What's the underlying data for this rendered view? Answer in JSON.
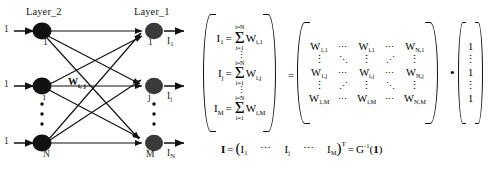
{
  "figure": {
    "type": "neural-network-matrix-equation",
    "background_color": "#ffffff",
    "ink_color": "#000000"
  },
  "diagram": {
    "left_layer_label": "Layer_2",
    "right_layer_label": "Layer_1",
    "left_nodes": [
      {
        "label": "1",
        "input_label": "1"
      },
      {
        "label": "i",
        "input_label": "1"
      },
      {
        "label": "N",
        "input_label": "1"
      }
    ],
    "right_nodes": [
      {
        "label": "1",
        "output_base": "I",
        "output_sub": "1"
      },
      {
        "label": "j",
        "output_base": "I",
        "output_sub": "j"
      },
      {
        "label": "M",
        "output_base": "I",
        "output_sub": "N"
      }
    ],
    "weight_label": {
      "base": "W",
      "sub": "i, j"
    },
    "vertical_dots": "•",
    "node_fill": "#111111"
  },
  "equation": {
    "sum_upper": "i=N",
    "sum_lower": "i=1",
    "sum_sign": "Σ",
    "equals": "=",
    "dot_operator": "•",
    "vdots": "⋮",
    "hdots": "⋯",
    "ddots": "⋱",
    "adots": "⋰",
    "lhs_rows": [
      {
        "lhs_base": "I",
        "lhs_sub": "1",
        "term_base": "W",
        "term_sub": "i,1"
      },
      {
        "lhs_base": "I",
        "lhs_sub": "j",
        "term_base": "W",
        "term_sub": "i,j"
      },
      {
        "lhs_base": "I",
        "lhs_sub": "M",
        "term_base": "W",
        "term_sub": "i,M"
      }
    ],
    "matrix_rows": [
      [
        "W|1,1",
        "⋯",
        "W|i,1",
        "⋯",
        "W|N,1"
      ],
      [
        "⋮",
        "⋱",
        "⋮",
        "⋰",
        "⋮"
      ],
      [
        "W|1,j",
        "⋯",
        "W|i,j",
        "⋯",
        "W|N,j"
      ],
      [
        "⋮",
        "⋰",
        "⋮",
        "⋱",
        "⋮"
      ],
      [
        "W|1,M",
        "⋯",
        "W|i,M",
        "⋯",
        "W|N,M"
      ]
    ],
    "ones_vector": [
      "1",
      "⋮",
      "1",
      "⋮",
      "1"
    ]
  },
  "bottom_equation": {
    "lhs": "I",
    "equals": "=",
    "open_paren": "(",
    "close_paren": ")",
    "transpose": "T",
    "elem_1_base": "I",
    "elem_1_sub": "1",
    "dots_1": "⋯",
    "elem_j_base": "I",
    "elem_j_sub": "j",
    "dots_2": "⋯",
    "elem_M_base": "I",
    "elem_M_sub": "M",
    "rhs_base": "G",
    "rhs_sup": "-1",
    "rhs_arg_open": "(",
    "rhs_arg": "1",
    "rhs_arg_close": ")"
  }
}
